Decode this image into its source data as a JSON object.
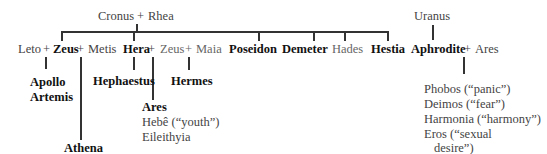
{
  "diagram": {
    "type": "family-tree",
    "parents": {
      "left": "Cronus",
      "joiner": "+",
      "right": "Rhea"
    },
    "uranus": "Uranus",
    "children_row": {
      "leto": "Leto",
      "plus1": "+",
      "zeus": "Zeus",
      "plus2": "+",
      "metis": "Metis",
      "hera": "Hera",
      "plus3": "+",
      "zeus2": "Zeus",
      "plus4": "+",
      "maia": "Maia",
      "poseidon": "Poseidon",
      "demeter": "Demeter",
      "hades": "Hades",
      "hestia": "Hestia",
      "aphrodite": "Aphrodite",
      "plus5": "+",
      "ares": "Ares"
    },
    "offspring": {
      "leto_zeus": [
        "Apollo",
        "Artemis"
      ],
      "zeus_metis": [
        "Athena"
      ],
      "hera": [
        "Hephaestus"
      ],
      "zeus_hera": [
        "Ares",
        "Hebê (“youth”)",
        "Eileithyia"
      ],
      "zeus_maia": [
        "Hermes"
      ],
      "aphrodite_ares": [
        "Phobos (“panic”)",
        "Deimos (“fear”)",
        "Harmonia (“harmony”)",
        "Eros (“sexual",
        "desire”)"
      ]
    }
  }
}
